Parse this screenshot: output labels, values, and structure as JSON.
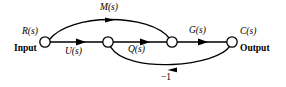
{
  "figure": {
    "type": "signal-flow-graph",
    "background_color": "#ffffff",
    "stroke_color": "#000000",
    "nodes": [
      {
        "id": "n1",
        "label_top": "R(s)",
        "label_bottom": "Input",
        "x": 45,
        "y": 42,
        "r": 5.2
      },
      {
        "id": "n2",
        "label_top": "",
        "label_bottom": "",
        "x": 108,
        "y": 42,
        "r": 5.2
      },
      {
        "id": "n3",
        "label_top": "",
        "label_bottom": "",
        "x": 172,
        "y": 42,
        "r": 5.2
      },
      {
        "id": "n4",
        "label_top": "C(s)",
        "label_bottom": "Output",
        "x": 232,
        "y": 42,
        "r": 5.2
      }
    ],
    "edges": [
      {
        "id": "e-m",
        "from": "n1",
        "to": "n3",
        "label": "M(s)",
        "shape": "arc-up",
        "direction": "forward"
      },
      {
        "id": "e-u",
        "from": "n1",
        "to": "n2",
        "label": "U(s)",
        "shape": "straight",
        "direction": "forward"
      },
      {
        "id": "e-q",
        "from": "n2",
        "to": "n3",
        "label": "Q(s)",
        "shape": "straight",
        "direction": "forward"
      },
      {
        "id": "e-g",
        "from": "n3",
        "to": "n4",
        "label": "G(s)",
        "shape": "straight",
        "direction": "forward"
      },
      {
        "id": "e-fb",
        "from": "n4",
        "to": "n2",
        "label": "-1",
        "shape": "arc-down",
        "direction": "reverse"
      }
    ],
    "labels": {
      "input_variable": "R(s)",
      "input_word": "Input",
      "output_variable": "C(s)",
      "output_word": "Output",
      "forward_top": "M(s)",
      "forward_first": "U(s)",
      "forward_second": "Q(s)",
      "forward_third": "G(s)",
      "feedback_gain": "−1"
    }
  }
}
